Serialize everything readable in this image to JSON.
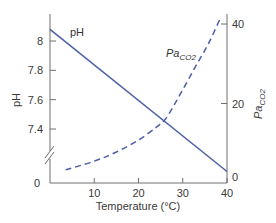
{
  "chart_data": {
    "type": "line",
    "title": "",
    "xlabel": "Temperature (°C)",
    "ylabel_left": "pH",
    "ylabel_right": {
      "base": "Pa",
      "sub": "CO2"
    },
    "xlim": [
      0,
      40
    ],
    "x_ticks": [
      10,
      20,
      30,
      40
    ],
    "left_axis": {
      "ticks": [
        "8",
        "7.8",
        "7.6",
        "7.4"
      ],
      "tick_values": [
        8.0,
        7.8,
        7.6,
        7.4
      ],
      "bottom_label": "0",
      "axis_break": true
    },
    "right_axis": {
      "ylim": [
        0,
        40
      ],
      "ticks": [
        0,
        20,
        40
      ],
      "tick_labels": [
        "0",
        "20",
        "40"
      ]
    },
    "grid": false,
    "series": [
      {
        "name": "pH",
        "label": "pH",
        "axis": "left",
        "style": "solid",
        "color": "#4a5fa8",
        "x": [
          0,
          40
        ],
        "y": [
          8.08,
          7.11
        ]
      },
      {
        "name": "PaCO2",
        "label_base": "Pa",
        "label_sub": "CO2",
        "axis": "right",
        "style": "dashed",
        "color": "#4a5fa8",
        "x": [
          3.5,
          10,
          15,
          20,
          24,
          26,
          28,
          30,
          33,
          36,
          38.5
        ],
        "y": [
          3.3,
          5.5,
          7.8,
          10.8,
          14.0,
          16.0,
          19.5,
          23.5,
          29.5,
          35.5,
          41.5
        ]
      }
    ]
  }
}
